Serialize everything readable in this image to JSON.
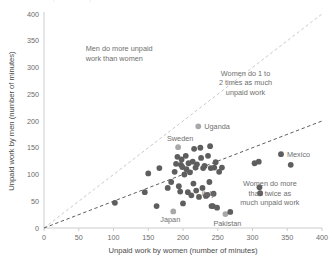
{
  "chart_data": {
    "type": "scatter",
    "title": "",
    "xlabel": "Unpaid work by women (number of minutes)",
    "ylabel": "Unpaid work by men (number of minutes)",
    "xlim": [
      0,
      400
    ],
    "ylim": [
      0,
      400
    ],
    "xticks": [
      0,
      50,
      100,
      150,
      200,
      250,
      300,
      350,
      400
    ],
    "yticks": [
      0,
      50,
      100,
      150,
      200,
      250,
      300,
      350,
      400
    ],
    "grid": false,
    "legend": "none",
    "point_color": "#5e5e5e",
    "highlight_color": "#a8a8a8",
    "reference_lines": [
      {
        "name": "parity-line",
        "label": "y = x",
        "style": "dashed",
        "color": "#c9c9c9",
        "from": [
          0,
          0
        ],
        "to": [
          400,
          400
        ]
      },
      {
        "name": "half-line",
        "label": "y = x / 2",
        "style": "dashed",
        "color": "#5e5e5e",
        "from": [
          0,
          0
        ],
        "to": [
          400,
          200
        ]
      }
    ],
    "annotations": [
      {
        "name": "men-more-annotation",
        "lines": [
          "Men do more unpaid",
          "work than women"
        ],
        "x": 60,
        "y": 330
      },
      {
        "name": "one-to-two-annotation",
        "lines": [
          "Women do 1 to",
          "2 times as much",
          "unpaid work"
        ],
        "x": 290,
        "y": 285
      },
      {
        "name": "twice-annotation",
        "lines": [
          "Women do more",
          "than twice as",
          "much unpaid work"
        ],
        "x": 325,
        "y": 78
      }
    ],
    "labeled_points": [
      {
        "name": "uganda",
        "label": "Uganda",
        "x": 222,
        "y": 190,
        "highlight": true,
        "label_side": "right"
      },
      {
        "name": "sweden",
        "label": "Sweden",
        "x": 193,
        "y": 151,
        "highlight": true,
        "label_side": "above"
      },
      {
        "name": "mexico",
        "label": "Mexico",
        "x": 341,
        "y": 138,
        "highlight": false,
        "label_side": "right"
      },
      {
        "name": "japan",
        "label": "Japan",
        "x": 186,
        "y": 31,
        "highlight": true,
        "label_side": "below-left"
      },
      {
        "name": "pakistan",
        "label": "Pakistan",
        "x": 261,
        "y": 26,
        "highlight": true,
        "label_side": "below"
      },
      {
        "name": "italy",
        "label": "Italy",
        "x": 235,
        "y": 62,
        "highlight": false,
        "label_side": "overlap"
      }
    ],
    "points": [
      {
        "x": 102,
        "y": 47
      },
      {
        "x": 145,
        "y": 67
      },
      {
        "x": 150,
        "y": 102
      },
      {
        "x": 162,
        "y": 41
      },
      {
        "x": 166,
        "y": 112
      },
      {
        "x": 178,
        "y": 75
      },
      {
        "x": 183,
        "y": 86
      },
      {
        "x": 186,
        "y": 31
      },
      {
        "x": 188,
        "y": 105
      },
      {
        "x": 190,
        "y": 120
      },
      {
        "x": 192,
        "y": 133
      },
      {
        "x": 193,
        "y": 151
      },
      {
        "x": 194,
        "y": 78
      },
      {
        "x": 196,
        "y": 68
      },
      {
        "x": 197,
        "y": 118
      },
      {
        "x": 198,
        "y": 128
      },
      {
        "x": 199,
        "y": 114
      },
      {
        "x": 200,
        "y": 46
      },
      {
        "x": 202,
        "y": 100
      },
      {
        "x": 204,
        "y": 135
      },
      {
        "x": 205,
        "y": 110
      },
      {
        "x": 207,
        "y": 67
      },
      {
        "x": 208,
        "y": 121
      },
      {
        "x": 210,
        "y": 104
      },
      {
        "x": 212,
        "y": 61
      },
      {
        "x": 214,
        "y": 124
      },
      {
        "x": 215,
        "y": 83
      },
      {
        "x": 216,
        "y": 148
      },
      {
        "x": 218,
        "y": 113
      },
      {
        "x": 219,
        "y": 70
      },
      {
        "x": 220,
        "y": 119
      },
      {
        "x": 222,
        "y": 190
      },
      {
        "x": 223,
        "y": 58
      },
      {
        "x": 225,
        "y": 150
      },
      {
        "x": 226,
        "y": 131
      },
      {
        "x": 228,
        "y": 75
      },
      {
        "x": 229,
        "y": 112
      },
      {
        "x": 231,
        "y": 116
      },
      {
        "x": 233,
        "y": 60
      },
      {
        "x": 235,
        "y": 62
      },
      {
        "x": 236,
        "y": 135
      },
      {
        "x": 238,
        "y": 86
      },
      {
        "x": 239,
        "y": 153
      },
      {
        "x": 240,
        "y": 112
      },
      {
        "x": 241,
        "y": 41
      },
      {
        "x": 243,
        "y": 41
      },
      {
        "x": 244,
        "y": 64
      },
      {
        "x": 245,
        "y": 113
      },
      {
        "x": 247,
        "y": 123
      },
      {
        "x": 249,
        "y": 38
      },
      {
        "x": 252,
        "y": 105
      },
      {
        "x": 256,
        "y": 113
      },
      {
        "x": 261,
        "y": 26
      },
      {
        "x": 268,
        "y": 30
      },
      {
        "x": 303,
        "y": 121
      },
      {
        "x": 309,
        "y": 124
      },
      {
        "x": 310,
        "y": 76
      },
      {
        "x": 311,
        "y": 65
      },
      {
        "x": 341,
        "y": 138
      },
      {
        "x": 355,
        "y": 118
      }
    ]
  },
  "cropped_header": "Unpaid work by women and men"
}
